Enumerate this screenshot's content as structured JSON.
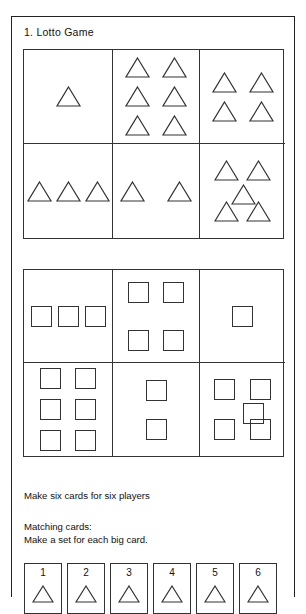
{
  "page": {
    "title": "1. Lotto Game",
    "ink_color": "#222222",
    "background_color": "#ffffff"
  },
  "big_card_grids": [
    {
      "name": "triangle-cards",
      "shape": "triangle",
      "cells": [
        {
          "index": 1,
          "count": 1,
          "arrangement": "single"
        },
        {
          "index": 2,
          "count": 6,
          "arrangement": "2x3"
        },
        {
          "index": 3,
          "count": 4,
          "arrangement": "2x2"
        },
        {
          "index": 4,
          "count": 3,
          "arrangement": "row"
        },
        {
          "index": 5,
          "count": 2,
          "arrangement": "row"
        },
        {
          "index": 6,
          "count": 5,
          "arrangement": "quincunx"
        }
      ]
    },
    {
      "name": "square-cards",
      "shape": "square",
      "cells": [
        {
          "index": 1,
          "count": 3,
          "arrangement": "row"
        },
        {
          "index": 2,
          "count": 4,
          "arrangement": "2x2"
        },
        {
          "index": 3,
          "count": 1,
          "arrangement": "single"
        },
        {
          "index": 4,
          "count": 6,
          "arrangement": "2x3"
        },
        {
          "index": 5,
          "count": 2,
          "arrangement": "column"
        },
        {
          "index": 6,
          "count": 5,
          "arrangement": "quincunx"
        }
      ]
    }
  ],
  "notes": {
    "line_1": "Make six cards for six players",
    "line_2": "Matching cards:",
    "line_3": "Make a set for each big card."
  },
  "small_cards": [
    {
      "number": "1",
      "shape": "triangle"
    },
    {
      "number": "2",
      "shape": "triangle"
    },
    {
      "number": "3",
      "shape": "triangle"
    },
    {
      "number": "4",
      "shape": "triangle"
    },
    {
      "number": "5",
      "shape": "triangle"
    },
    {
      "number": "6",
      "shape": "triangle"
    }
  ]
}
